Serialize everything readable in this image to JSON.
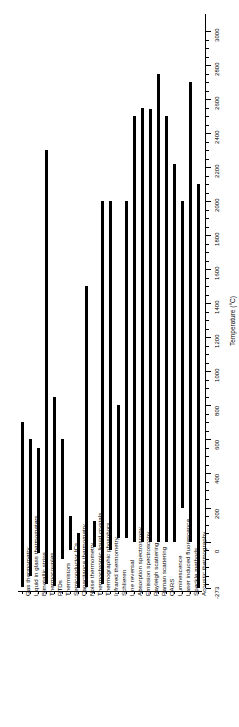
{
  "chart_data": {
    "type": "bar",
    "orientation": "floating-range-bars",
    "title": "",
    "xlabel": "",
    "ylabel": "Temperature (°C)",
    "ylim": [
      -273,
      3100
    ],
    "grid": false,
    "legend": null,
    "axis": {
      "label": "Temperature (°C)",
      "min": -273,
      "max": 3100,
      "major_ticks": [
        -273,
        0,
        200,
        400,
        600,
        800,
        1000,
        1200,
        1400,
        1600,
        1800,
        2000,
        2200,
        2400,
        2600,
        2800,
        3000
      ],
      "major_tick_labels": [
        "-273",
        "0",
        "200",
        "400",
        "600",
        "800",
        "1000",
        "1200",
        "1400",
        "1600",
        "1800",
        "2000",
        "2200",
        "2400",
        "2600",
        "2800",
        "3000"
      ],
      "minor_tick_step": 50
    },
    "categories": [
      "Gas thermometry",
      "Liquid in glass thermometers",
      "Bimetallic strips",
      "Thermocouples",
      "RTDs",
      "Thermistors",
      "Semiconductor ICs",
      "Capacitance thermometry",
      "Noise thermometry",
      "Thermochromic liquid crystals",
      "Thermographic phosphors",
      "Infrared thermometry",
      "Schlieren",
      "Line reversal",
      "Absorption spectroscopy",
      "Emission spectroscopy",
      "Rayleigh scattering",
      "Raman scattering",
      "CARS",
      "Luminescence",
      "Laser induced fluorescence",
      "Speckle methods",
      "Acoustic thermography"
    ],
    "series": [
      {
        "name": "Temperature range (°C)",
        "ranges": [
          {
            "category": "Gas thermometry",
            "low": -270,
            "high": 700
          },
          {
            "category": "Liquid in glass thermometers",
            "low": -200,
            "high": 600
          },
          {
            "category": "Bimetallic strips",
            "low": -70,
            "high": 550
          },
          {
            "category": "Thermocouples",
            "low": -250,
            "high": 2300
          },
          {
            "category": "RTDs",
            "low": -260,
            "high": 850
          },
          {
            "category": "Thermistors",
            "low": -100,
            "high": 600
          },
          {
            "category": "Semiconductor ICs",
            "low": -50,
            "high": 150
          },
          {
            "category": "Capacitance thermometry",
            "low": -273,
            "high": 50
          },
          {
            "category": "Noise thermometry",
            "low": -270,
            "high": 1500
          },
          {
            "category": "Thermochromic liquid crystals",
            "low": -30,
            "high": 120
          },
          {
            "category": "Thermographic phosphors",
            "low": -250,
            "high": 2000
          },
          {
            "category": "Infrared thermometry",
            "low": -50,
            "high": 2000
          },
          {
            "category": "Schlieren",
            "low": 20,
            "high": 800
          },
          {
            "category": "Line reversal",
            "low": 20,
            "high": 2000
          },
          {
            "category": "Absorption spectroscopy",
            "low": 0,
            "high": 2500
          },
          {
            "category": "Emission spectroscopy",
            "low": 0,
            "high": 2550
          },
          {
            "category": "Rayleigh scattering",
            "low": 0,
            "high": 2540
          },
          {
            "category": "Raman scattering",
            "low": 0,
            "high": 2750
          },
          {
            "category": "CARS",
            "low": 0,
            "high": 2500
          },
          {
            "category": "Luminescence",
            "low": 0,
            "high": 2220
          },
          {
            "category": "Laser induced fluorescence",
            "low": 200,
            "high": 2000
          },
          {
            "category": "Speckle methods",
            "low": 0,
            "high": 2700
          },
          {
            "category": "Acoustic thermography",
            "low": -273,
            "high": 2100
          }
        ]
      }
    ]
  }
}
